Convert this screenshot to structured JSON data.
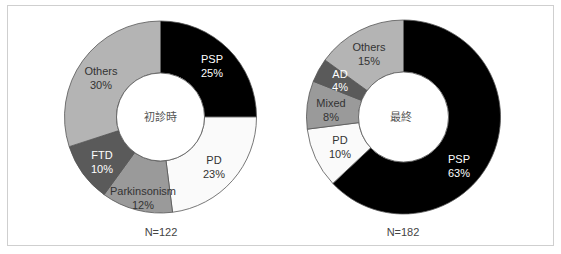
{
  "chart_data": [
    {
      "type": "pie",
      "variant": "donut",
      "center_label": "初診時",
      "footer": "N=122",
      "slices": [
        {
          "label": "PSP",
          "value": 25,
          "color": "#000000",
          "text_color": "#ffffff"
        },
        {
          "label": "PD",
          "value": 23,
          "color": "#fafafa",
          "text_color": "#333333"
        },
        {
          "label": "Parkinsonism",
          "value": 12,
          "color": "#9a9a9a",
          "text_color": "#333333"
        },
        {
          "label": "FTD",
          "value": 10,
          "color": "#5a5a5a",
          "text_color": "#ffffff"
        },
        {
          "label": "Others",
          "value": 30,
          "color": "#b4b4b4",
          "text_color": "#333333"
        }
      ]
    },
    {
      "type": "pie",
      "variant": "donut",
      "center_label": "最終",
      "footer": "N=182",
      "slices": [
        {
          "label": "PSP",
          "value": 63,
          "color": "#000000",
          "text_color": "#ffffff"
        },
        {
          "label": "PD",
          "value": 10,
          "color": "#fafafa",
          "text_color": "#333333"
        },
        {
          "label": "Mixed",
          "value": 8,
          "color": "#9a9a9a",
          "text_color": "#333333"
        },
        {
          "label": "AD",
          "value": 4,
          "color": "#5a5a5a",
          "text_color": "#ffffff"
        },
        {
          "label": "Others",
          "value": 15,
          "color": "#b4b4b4",
          "text_color": "#333333"
        }
      ]
    }
  ],
  "charts": {
    "left": {
      "center_label": "初診時",
      "footer": "N=122",
      "labels": {
        "psp": {
          "name": "PSP",
          "pct": "25%"
        },
        "pd": {
          "name": "PD",
          "pct": "23%"
        },
        "parkinsonism": {
          "name": "Parkinsonism",
          "pct": "12%"
        },
        "ftd": {
          "name": "FTD",
          "pct": "10%"
        },
        "others": {
          "name": "Others",
          "pct": "30%"
        }
      }
    },
    "right": {
      "center_label": "最終",
      "footer": "N=182",
      "labels": {
        "psp": {
          "name": "PSP",
          "pct": "63%"
        },
        "pd": {
          "name": "PD",
          "pct": "10%"
        },
        "mixed": {
          "name": "Mixed",
          "pct": "8%"
        },
        "ad": {
          "name": "AD",
          "pct": "4%"
        },
        "others": {
          "name": "Others",
          "pct": "15%"
        }
      }
    }
  }
}
